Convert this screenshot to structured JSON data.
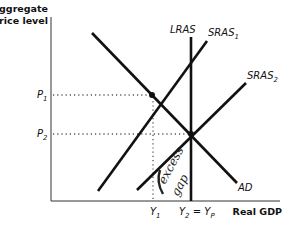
{
  "diagram": {
    "y_axis_label_line1": "Aggregate",
    "y_axis_label_line2": "price level",
    "x_axis_label": "Real GDP",
    "curves": {
      "ad": "AD",
      "lras": "LRAS",
      "sras1": {
        "base": "SRAS",
        "sub": "1"
      },
      "sras2": {
        "base": "SRAS",
        "sub": "2"
      }
    },
    "price_ticks": [
      {
        "base": "P",
        "sub": "1"
      },
      {
        "base": "P",
        "sub": "2"
      }
    ],
    "output_ticks": {
      "y1": {
        "base": "Y",
        "sub": "1"
      },
      "y2": {
        "base": "Y",
        "sub": "2",
        "eq": " = ",
        "base2": "Y",
        "sub2": "P"
      }
    },
    "annotation": {
      "line1": "excess",
      "line2": "gap"
    },
    "colors": {
      "curve": "#111111",
      "axis": "#333333"
    }
  }
}
